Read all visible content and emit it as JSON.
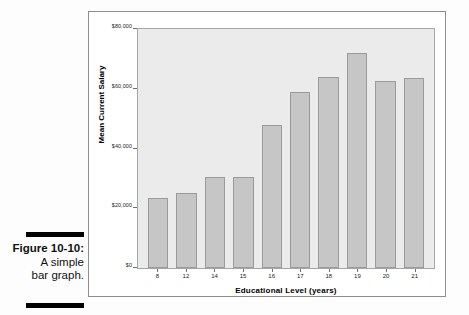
{
  "caption": {
    "title": "Figure 10-10:",
    "line2": "A simple",
    "line3": "bar graph."
  },
  "chart_data": {
    "type": "bar",
    "title": "",
    "xlabel": "Educational Level (years)",
    "ylabel": "Mean Current Salary",
    "categories": [
      "8",
      "12",
      "14",
      "15",
      "16",
      "17",
      "18",
      "19",
      "20",
      "21"
    ],
    "values": [
      23500,
      25000,
      30500,
      30500,
      48000,
      59000,
      64000,
      72000,
      62500,
      63500
    ],
    "ylim": [
      0,
      80000
    ],
    "ytick_values": [
      0,
      20000,
      40000,
      60000,
      80000
    ],
    "ytick_labels": [
      "$0",
      "$20,000",
      "$40,000",
      "$60,000",
      "$80,000"
    ],
    "grid": false,
    "legend": null,
    "bar_color": "#c6c6c6",
    "bar_border_color": "#9a9a9a",
    "plot_background": "#ebebeb",
    "frame_color": "#8d8d8d"
  }
}
